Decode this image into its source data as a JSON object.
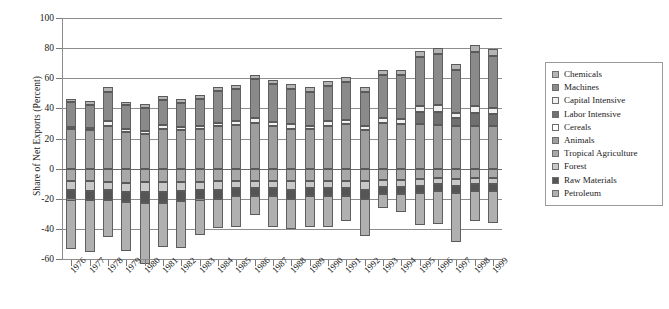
{
  "chart_data": {
    "type": "bar",
    "subtype": "stacked-diverging",
    "title": "",
    "xlabel": "",
    "ylabel": "Share of Net Exports (Percent)",
    "ylim": [
      -60,
      100
    ],
    "yticks": [
      100,
      80,
      60,
      40,
      20,
      0,
      -20,
      -40,
      -60
    ],
    "ytick_labels": [
      "100",
      "80",
      "60",
      "40",
      "20",
      "0",
      "-20",
      "-40",
      "-60"
    ],
    "grid": true,
    "legend_position": "right",
    "categories": [
      "1976",
      "1977",
      "1978",
      "1979",
      "1980",
      "1981",
      "1982",
      "1983",
      "1984",
      "1985",
      "1986",
      "1987",
      "1988",
      "1989",
      "1990",
      "1991",
      "1992",
      "1993",
      "1994",
      "1995",
      "1996",
      "1997",
      "1998",
      "1999"
    ],
    "series": [
      {
        "name": "Chemicals",
        "color": "#b4b4b4",
        "values": [
          2.5,
          2.5,
          3.0,
          2.5,
          2.5,
          2.5,
          2.5,
          2.5,
          2.5,
          2.5,
          2.5,
          3.0,
          3.0,
          3.0,
          3.0,
          3.0,
          3.0,
          3.5,
          3.5,
          4.0,
          4.0,
          4.0,
          4.5,
          4.5
        ]
      },
      {
        "name": "Machines",
        "color": "#8a8a8a",
        "values": [
          16.5,
          15.5,
          19.5,
          16.0,
          15.5,
          16.5,
          16.0,
          18.5,
          21.0,
          21.5,
          26.0,
          25.0,
          23.5,
          22.5,
          23.5,
          25.0,
          23.0,
          28.5,
          29.0,
          32.5,
          34.0,
          28.5,
          36.0,
          35.0
        ]
      },
      {
        "name": "Capital Intensive",
        "color": "#f0f0f0",
        "values": [
          1.5,
          1.5,
          3.0,
          2.0,
          2.0,
          2.5,
          2.0,
          2.0,
          2.5,
          2.5,
          3.0,
          2.5,
          3.0,
          2.5,
          3.0,
          3.0,
          2.5,
          3.0,
          3.5,
          4.0,
          4.5,
          3.5,
          4.5,
          4.0
        ]
      },
      {
        "name": "Labor Intensive",
        "color": "#707070",
        "values": [
          0.0,
          0.0,
          0.0,
          0.0,
          0.0,
          0.0,
          0.0,
          0.0,
          0.0,
          0.0,
          0.0,
          0.0,
          0.0,
          0.0,
          0.0,
          0.0,
          0.0,
          0.0,
          0.0,
          8.0,
          8.5,
          5.5,
          8.5,
          8.0
        ]
      },
      {
        "name": "Cereals",
        "color": "#ffffff",
        "values": [
          0.0,
          0.0,
          0.0,
          0.0,
          0.0,
          0.0,
          0.0,
          0.0,
          0.0,
          0.0,
          0.0,
          0.0,
          0.0,
          0.0,
          0.0,
          0.0,
          0.0,
          0.0,
          0.0,
          0.0,
          0.0,
          0.0,
          0.0,
          0.0
        ]
      },
      {
        "name": "Animals",
        "color": "#9e9e9e",
        "values": [
          26.0,
          25.5,
          28.5,
          24.0,
          23.0,
          26.5,
          25.5,
          26.0,
          28.0,
          29.0,
          30.5,
          28.5,
          26.5,
          26.0,
          28.5,
          29.5,
          25.5,
          30.5,
          29.5,
          29.5,
          29.0,
          28.0,
          28.5,
          28.0
        ]
      },
      {
        "name": "Tropical Agriculture",
        "color": "#a8a8a8",
        "values": [
          -8.0,
          -8.5,
          -9.0,
          -9.5,
          -9.0,
          -9.0,
          -9.0,
          -9.0,
          -8.5,
          -8.0,
          -8.0,
          -8.0,
          -8.5,
          -8.0,
          -8.0,
          -8.0,
          -8.5,
          -7.5,
          -7.5,
          -7.0,
          -6.5,
          -7.0,
          -6.5,
          -6.5
        ]
      },
      {
        "name": "Forest",
        "color": "#c8c8c8",
        "values": [
          -6.0,
          -6.5,
          -5.5,
          -6.0,
          -6.5,
          -6.5,
          -6.0,
          -5.5,
          -5.5,
          -5.0,
          -5.0,
          -5.0,
          -5.5,
          -5.0,
          -5.0,
          -5.0,
          -5.5,
          -4.5,
          -4.5,
          -4.5,
          -4.0,
          -4.5,
          -4.0,
          -4.0
        ]
      },
      {
        "name": "Raw Materials",
        "color": "#555555",
        "values": [
          -6.5,
          -6.0,
          -6.5,
          -6.5,
          -7.0,
          -7.0,
          -6.5,
          -6.0,
          -6.0,
          -5.5,
          -5.5,
          -5.5,
          -6.0,
          -5.5,
          -5.5,
          -5.5,
          -6.0,
          -5.0,
          -5.0,
          -4.5,
          -4.5,
          -5.0,
          -4.5,
          -4.5
        ]
      },
      {
        "name": "Petroleum",
        "color": "#b0b0b0",
        "values": [
          -33.0,
          -34.5,
          -24.5,
          -33.0,
          -40.5,
          -29.5,
          -31.5,
          -23.5,
          -19.5,
          -20.5,
          -12.5,
          -20.5,
          -20.0,
          -20.5,
          -20.5,
          -16.5,
          -24.5,
          -9.0,
          -11.5,
          -21.5,
          -21.5,
          -32.5,
          -20.0,
          -21.0
        ]
      }
    ],
    "bar_totals_positive": [
      46.5,
      45.0,
      54.0,
      44.5,
      43.0,
      48.0,
      46.0,
      49.0,
      54.0,
      55.5,
      62.0,
      59.0,
      56.0,
      54.0,
      58.0,
      60.5,
      54.0,
      65.5,
      65.5,
      78.0,
      80.0,
      69.0,
      82.0,
      79.5
    ],
    "bar_totals_negative": [
      -53.5,
      -55.5,
      -45.5,
      -55.0,
      -63.0,
      -52.0,
      -53.0,
      -44.0,
      -39.5,
      -39.0,
      -31.0,
      -39.0,
      -40.0,
      -39.0,
      -39.0,
      -35.0,
      -44.5,
      -26.0,
      -28.5,
      -37.5,
      -36.5,
      -49.0,
      -35.0,
      -36.0
    ]
  },
  "legend": {
    "items": [
      {
        "label": "Chemicals",
        "color": "#b4b4b4"
      },
      {
        "label": "Machines",
        "color": "#8a8a8a"
      },
      {
        "label": "Capital Intensive",
        "color": "#f0f0f0"
      },
      {
        "label": "Labor Intensive",
        "color": "#707070"
      },
      {
        "label": "Cereals",
        "color": "#ffffff"
      },
      {
        "label": "Animals",
        "color": "#9e9e9e"
      },
      {
        "label": "Tropical Agriculture",
        "color": "#a8a8a8"
      },
      {
        "label": "Forest",
        "color": "#c8c8c8"
      },
      {
        "label": "Raw Materials",
        "color": "#555555"
      },
      {
        "label": "Petroleum",
        "color": "#b0b0b0"
      }
    ]
  },
  "axis": {
    "y_title": "Share of Net Exports (Percent)"
  }
}
